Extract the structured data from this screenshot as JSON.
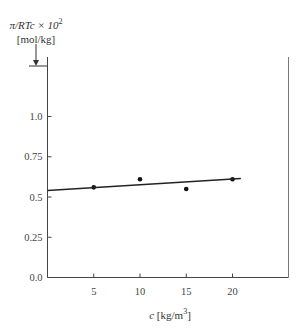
{
  "chart_data": {
    "type": "scatter",
    "title": "",
    "ylabel": "π/RTc × 10² [mol/kg]",
    "ylabel_line1": "π/RTc × 10",
    "ylabel_sup": "2",
    "ylabel_line2": "[mol/kg]",
    "xlabel": "c [kg/m³]",
    "xlabel_var": "c",
    "xlabel_unit": "[kg/m",
    "xlabel_sup": "3",
    "xlabel_close": "]",
    "xlim": [
      0,
      25
    ],
    "ylim": [
      0,
      1.35
    ],
    "x_ticks": [
      5,
      10,
      15,
      20
    ],
    "x_tick_labels": [
      "5",
      "10",
      "15",
      "20"
    ],
    "y_ticks": [
      0.0,
      0.25,
      0.5,
      0.75,
      1.0
    ],
    "y_tick_labels": [
      "0.0",
      "0.25",
      "0.5",
      "0.75",
      "1.0"
    ],
    "grid": false,
    "legend": null,
    "series": [
      {
        "name": "measured",
        "kind": "points",
        "x": [
          5,
          10,
          15,
          20
        ],
        "y": [
          0.56,
          0.61,
          0.55,
          0.61
        ]
      },
      {
        "name": "linear fit",
        "kind": "line",
        "x": [
          0,
          20.9
        ],
        "y": [
          0.54,
          0.615
        ]
      }
    ],
    "annotations": [
      {
        "type": "arrow",
        "target": "y-intercept marker at top of axis"
      }
    ]
  }
}
